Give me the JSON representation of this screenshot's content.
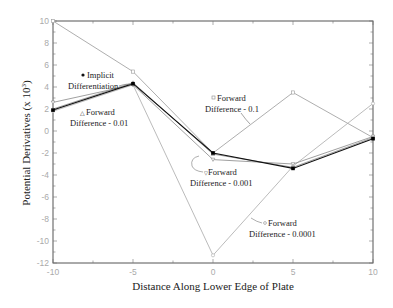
{
  "chart_data": {
    "type": "line",
    "title": "",
    "xlabel": "Distance Along Lower Edge of Plate",
    "ylabel": "Potential Derivatives (x 10",
    "ylabel_sup": "3",
    "ylabel_close": ")",
    "xlim": [
      -10,
      10
    ],
    "ylim": [
      -12,
      10
    ],
    "xticks": [
      -10,
      -5,
      0,
      5,
      10
    ],
    "xtick_labels": [
      "-10",
      "-5",
      "0",
      "5",
      "10"
    ],
    "yticks": [
      10,
      8,
      6,
      4,
      2,
      0,
      -2,
      -4,
      -6,
      -8,
      -10,
      -12
    ],
    "ytick_labels": [
      "10",
      "8",
      "6",
      "4",
      "2",
      "0",
      "-2",
      "-4",
      "-6",
      "-8",
      "-10",
      "-12"
    ],
    "grid": false,
    "x": [
      -10,
      -5,
      0,
      5,
      10
    ],
    "series": [
      {
        "name": "Implicit Differentiation",
        "marker": "filled-square",
        "color": "#111111",
        "values": [
          1.9,
          4.3,
          -2.0,
          -3.4,
          -0.7
        ]
      },
      {
        "name": "Forward Difference - 0.01",
        "marker": "triangle",
        "color": "#888888",
        "values": [
          2.0,
          4.4,
          -2.1,
          -3.3,
          -0.6
        ]
      },
      {
        "name": "Forward Difference - 0.1",
        "marker": "open-square",
        "color": "#999999",
        "values": [
          10.0,
          5.4,
          -2.0,
          3.5,
          -0.6
        ]
      },
      {
        "name": "Forward Difference - 0.001",
        "marker": "triangle-down",
        "color": "#888888",
        "values": [
          2.6,
          4.2,
          -2.6,
          -3.0,
          -0.5
        ]
      },
      {
        "name": "Forward Difference - 0.0001",
        "marker": "open-circle",
        "color": "#aaaaaa",
        "values": [
          1.8,
          4.2,
          -11.3,
          -3.2,
          2.5
        ]
      }
    ],
    "annotations": [
      {
        "line1": "Implicit",
        "line2": "Differentiation",
        "marker": "dot"
      },
      {
        "line1": "Forward",
        "line2": "Difference - 0.01",
        "marker": "triangle"
      },
      {
        "line1": "Forward",
        "line2": "Difference - 0.1",
        "marker": "square"
      },
      {
        "line1": "Forward",
        "line2": "Difference - 0.001",
        "marker": "triangle-down"
      },
      {
        "line1": "Forward",
        "line2": "Difference - 0.0001",
        "marker": "circle"
      }
    ]
  }
}
